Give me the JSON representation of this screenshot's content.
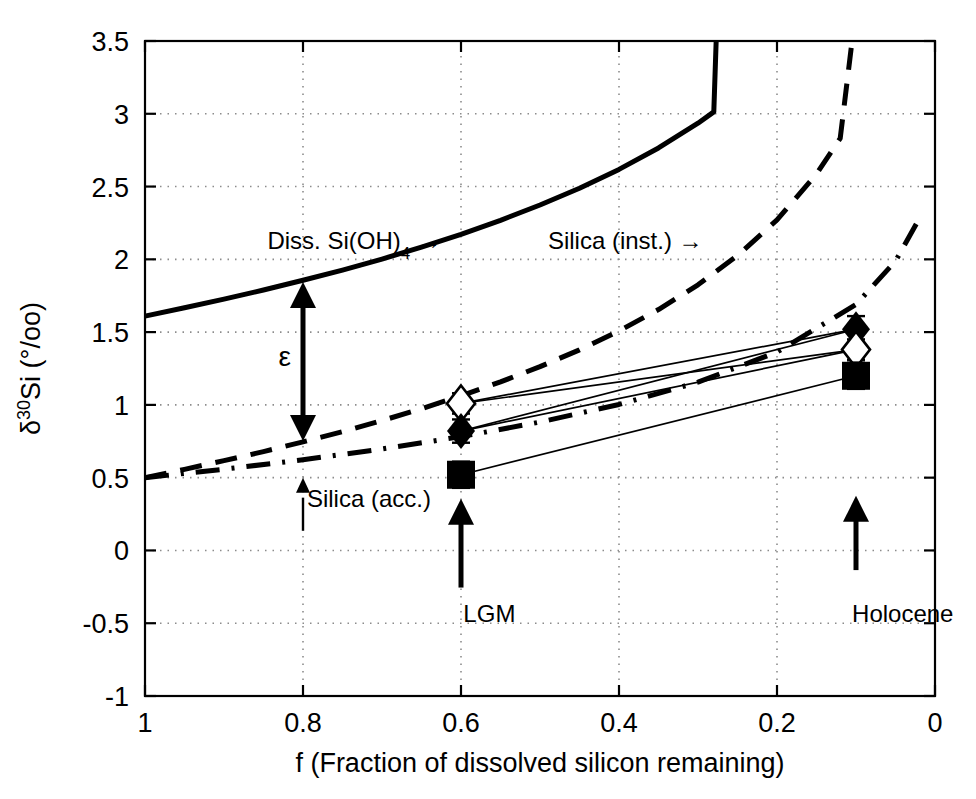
{
  "chart_data": {
    "type": "line",
    "title": "",
    "xlabel": "f (Fraction of dissolved silicon remaining)",
    "ylabel": "δ³⁰Si (°/oo)",
    "xlim": [
      1.0,
      0.0
    ],
    "ylim": [
      -1.0,
      3.5
    ],
    "x_reversed": true,
    "grid": true,
    "grid_style": "dotted",
    "legend_position": "none",
    "xticks": [
      1,
      0.8,
      0.6,
      0.4,
      0.2,
      0
    ],
    "xtick_labels": [
      "1",
      "0.8",
      "0.6",
      "0.4",
      "0.2",
      "0"
    ],
    "yticks": [
      -1,
      -0.5,
      0,
      0.5,
      1,
      1.5,
      2,
      2.5,
      3,
      3.5
    ],
    "ytick_labels": [
      "-1",
      "-0.5",
      "0",
      "0.5",
      "1",
      "1.5",
      "2",
      "2.5",
      "3",
      "3.5"
    ],
    "model": {
      "description": "Rayleigh fractionation of silicon isotopes",
      "epsilon": -1.1,
      "delta_initial": 0.5
    },
    "series": [
      {
        "name": "Diss. Si(OH)4",
        "style": "solid",
        "linewidth": 5,
        "color": "#000000",
        "points": [
          [
            1.0,
            1.61
          ],
          [
            0.95,
            1.667
          ],
          [
            0.9,
            1.727
          ],
          [
            0.85,
            1.789
          ],
          [
            0.8,
            1.856
          ],
          [
            0.75,
            1.926
          ],
          [
            0.7,
            2.002
          ],
          [
            0.65,
            2.084
          ],
          [
            0.6,
            2.172
          ],
          [
            0.55,
            2.268
          ],
          [
            0.5,
            2.373
          ],
          [
            0.45,
            2.488
          ],
          [
            0.4,
            2.618
          ],
          [
            0.35,
            2.765
          ],
          [
            0.3,
            2.935
          ],
          [
            0.28,
            3.013
          ],
          [
            0.277,
            3.5
          ]
        ]
      },
      {
        "name": "Silica (inst.)",
        "style": "dashed",
        "linewidth": 5,
        "color": "#000000",
        "points": [
          [
            1.0,
            0.5
          ],
          [
            0.95,
            0.557
          ],
          [
            0.9,
            0.617
          ],
          [
            0.85,
            0.679
          ],
          [
            0.8,
            0.746
          ],
          [
            0.75,
            0.816
          ],
          [
            0.7,
            0.892
          ],
          [
            0.65,
            0.974
          ],
          [
            0.6,
            1.062
          ],
          [
            0.55,
            1.158
          ],
          [
            0.5,
            1.263
          ],
          [
            0.45,
            1.378
          ],
          [
            0.4,
            1.508
          ],
          [
            0.35,
            1.655
          ],
          [
            0.3,
            1.825
          ],
          [
            0.25,
            2.026
          ],
          [
            0.2,
            2.271
          ],
          [
            0.15,
            2.586
          ],
          [
            0.12,
            2.831
          ],
          [
            0.105,
            3.5
          ]
        ]
      },
      {
        "name": "Silica (acc.)",
        "style": "dash-dot",
        "linewidth": 5,
        "color": "#000000",
        "points": [
          [
            1.0,
            0.5
          ],
          [
            0.9,
            0.558
          ],
          [
            0.8,
            0.623
          ],
          [
            0.7,
            0.697
          ],
          [
            0.6,
            0.782
          ],
          [
            0.5,
            0.882
          ],
          [
            0.4,
            1.003
          ],
          [
            0.3,
            1.156
          ],
          [
            0.2,
            1.363
          ],
          [
            0.1,
            1.69
          ],
          [
            0.05,
            1.988
          ],
          [
            0.02,
            2.279
          ]
        ]
      }
    ],
    "data_points": [
      {
        "label": "LGM open diamond",
        "marker": "open-diamond",
        "x": 0.6,
        "y": 1.01,
        "yerr": 0.07
      },
      {
        "label": "LGM filled diamond",
        "marker": "filled-diamond",
        "x": 0.6,
        "y": 0.82,
        "yerr": 0.08
      },
      {
        "label": "LGM filled square",
        "marker": "filled-square",
        "x": 0.6,
        "y": 0.52,
        "yerr": 0.09
      },
      {
        "label": "Holocene filled diamond",
        "marker": "filled-diamond",
        "x": 0.1,
        "y": 1.52,
        "yerr": 0.09
      },
      {
        "label": "Holocene open diamond",
        "marker": "open-diamond",
        "x": 0.1,
        "y": 1.38,
        "yerr": 0.07
      },
      {
        "label": "Holocene filled square",
        "marker": "filled-square",
        "x": 0.1,
        "y": 1.2,
        "yerr": 0.09
      }
    ],
    "connectors": [
      {
        "from": [
          0.6,
          1.01
        ],
        "to": [
          0.1,
          1.52
        ]
      },
      {
        "from": [
          0.6,
          1.01
        ],
        "to": [
          0.1,
          1.38
        ]
      },
      {
        "from": [
          0.6,
          0.82
        ],
        "to": [
          0.1,
          1.52
        ]
      },
      {
        "from": [
          0.6,
          0.82
        ],
        "to": [
          0.1,
          1.38
        ]
      },
      {
        "from": [
          0.6,
          0.52
        ],
        "to": [
          0.1,
          1.2
        ]
      }
    ],
    "annotations": [
      {
        "name": "diss-si-label",
        "text": "Diss. Si(OH)",
        "sub": "4",
        "suffix": " →",
        "x": 0.845,
        "y": 2.07
      },
      {
        "name": "silica-inst-label",
        "text": "Silica (inst.) →",
        "x": 0.49,
        "y": 2.07
      },
      {
        "name": "silica-acc-label",
        "text": "Silica (acc.)",
        "x": 0.795,
        "y": 0.3
      },
      {
        "name": "epsilon-label",
        "text": "ε",
        "x": 0.823,
        "y": 1.27
      },
      {
        "name": "lgm-label",
        "text": "LGM",
        "x": 0.597,
        "y": -0.49
      },
      {
        "name": "holocene-label",
        "text": "Holocene",
        "x": 0.105,
        "y": -0.49
      }
    ],
    "arrows": [
      {
        "name": "epsilon-arrow",
        "type": "double-headed-vertical",
        "x": 0.8,
        "y0": 0.752,
        "y1": 1.845
      },
      {
        "name": "silica-acc-arrow",
        "type": "up",
        "x": 0.8,
        "y0": 0.135,
        "y1": 0.5
      },
      {
        "name": "lgm-arrow",
        "type": "up",
        "x": 0.6,
        "y0": -0.255,
        "y1": 0.355
      },
      {
        "name": "holocene-arrow",
        "type": "up",
        "x": 0.1,
        "y0": -0.135,
        "y1": 0.375
      }
    ]
  },
  "colors": {
    "line": "#000000",
    "grid": "#8c8c8c",
    "axis": "#000000",
    "background": "#ffffff"
  }
}
